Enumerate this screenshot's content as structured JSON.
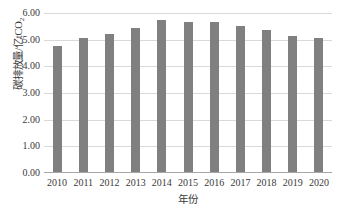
{
  "chart_data": {
    "type": "bar",
    "title": "",
    "subtitle": "",
    "categories": [
      "2010",
      "2011",
      "2012",
      "2013",
      "2014",
      "2015",
      "2016",
      "2017",
      "2018",
      "2019",
      "2020"
    ],
    "values": [
      4.78,
      5.08,
      5.22,
      5.45,
      5.75,
      5.68,
      5.68,
      5.53,
      5.38,
      5.13,
      5.07
    ],
    "series": [
      {
        "name": "碳排放量",
        "values": [
          4.78,
          5.08,
          5.22,
          5.45,
          5.75,
          5.68,
          5.68,
          5.53,
          5.38,
          5.13,
          5.07
        ]
      }
    ],
    "xlabel": "年份",
    "ylabel": "碳排放量/亿tCO₂",
    "ylabel_main": "碳排放量/亿tCO",
    "ylabel_sub": "2",
    "ylim": [
      0.0,
      6.0
    ],
    "ytick_step": 1.0,
    "ytick_labels": [
      "6.00",
      "5.00",
      "4.00",
      "3.00",
      "2.00",
      "1.00",
      "0.00"
    ],
    "ytick_values": [
      6.0,
      5.0,
      4.0,
      3.0,
      2.0,
      1.0,
      0.0
    ],
    "xtick_labels": [
      "2010",
      "2011",
      "2012",
      "2013",
      "2014",
      "2015",
      "2016",
      "2017",
      "2018",
      "2019",
      "2020"
    ],
    "grid": "horizontal",
    "legend": "none",
    "bar_color": "#808080",
    "gridline_color": "#d9d9d9",
    "axis_color": "#a6a6a6",
    "background_color": "#ffffff",
    "annotations": []
  }
}
